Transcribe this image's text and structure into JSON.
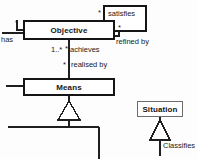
{
  "diagram": {
    "type": "uml-class-diagram",
    "background_color": "#fdfdfd",
    "line_color": "#1f1f1f",
    "classes": [
      {
        "id": "objective",
        "name": "Objective",
        "x": 23,
        "y": 20,
        "w": 92,
        "h": 20,
        "border": "thick"
      },
      {
        "id": "satisfies_box",
        "name": "",
        "x": 103,
        "y": 5,
        "w": 44,
        "h": 27,
        "border": "thick"
      },
      {
        "id": "means",
        "name": "Means",
        "x": 23,
        "y": 78,
        "w": 92,
        "h": 18,
        "border": "thick"
      },
      {
        "id": "situation",
        "name": "Situation",
        "x": 137,
        "y": 101,
        "w": 46,
        "h": 16,
        "border": "thin"
      }
    ],
    "association_labels": [
      {
        "id": "satisfies",
        "text": "satisfies",
        "x": 108,
        "y": 10
      },
      {
        "id": "refined_by",
        "text": "refined by",
        "x": 116,
        "y": 38
      },
      {
        "id": "has",
        "text": "has",
        "x": 1,
        "y": 37
      },
      {
        "id": "achieves",
        "text": "achieves",
        "x": 70,
        "y": 47
      },
      {
        "id": "realised_by",
        "text": "realised by",
        "x": 70,
        "y": 62
      },
      {
        "id": "classifies",
        "text": "Classifies",
        "x": 157,
        "y": 143
      }
    ],
    "multiplicities": [
      {
        "id": "satisfies-source-mult",
        "text": "*",
        "x": 98,
        "y": 10
      },
      {
        "id": "refined-by-mult",
        "text": "*",
        "x": 118,
        "y": 25
      },
      {
        "id": "has-mult",
        "text": "*",
        "x": 16,
        "y": 21
      },
      {
        "id": "achieves-mult",
        "text": "1..*",
        "x": 52,
        "y": 47
      },
      {
        "id": "achieves-star-mult",
        "text": "*",
        "x": 66,
        "y": 47
      },
      {
        "id": "realised-by-mult",
        "text": "*",
        "x": 63,
        "y": 62
      }
    ],
    "generalizations": [
      {
        "id": "means-generalization",
        "from": "means",
        "note": "hollow triangle below Means"
      },
      {
        "id": "situation-generalization",
        "from": "situation",
        "note": "hollow triangle below Situation"
      }
    ]
  }
}
